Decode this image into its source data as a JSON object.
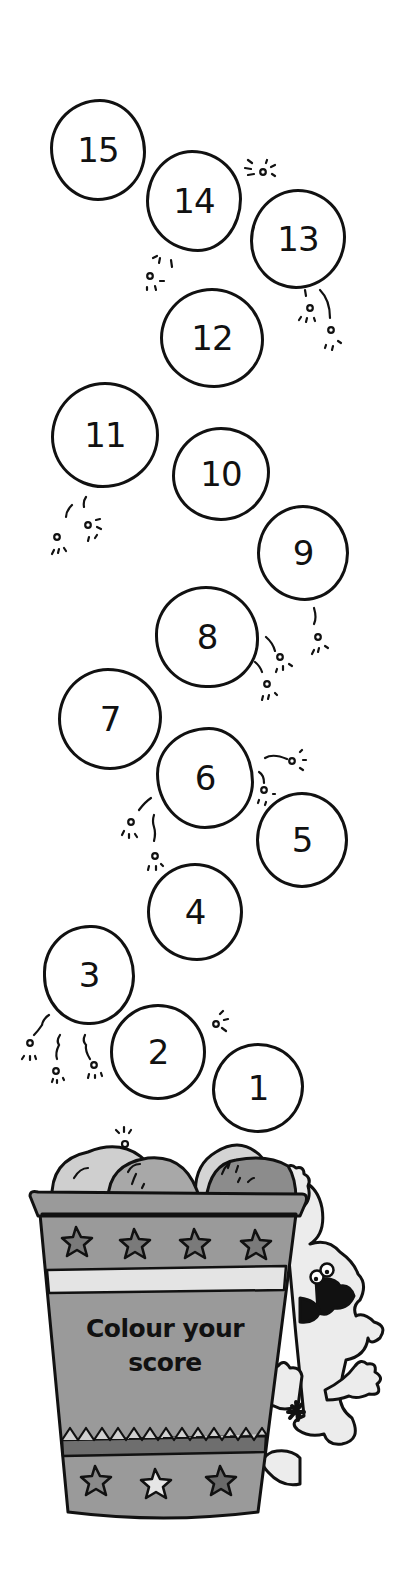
{
  "worksheet": {
    "instruction_line1": "Colour your",
    "instruction_line2": "score",
    "balloons": [
      {
        "label": "15",
        "cx": 98,
        "cy": 150,
        "w": 96,
        "h": 102,
        "r": "52% 48% 50% 50% / 48% 52% 48% 52%"
      },
      {
        "label": "14",
        "cx": 194,
        "cy": 201,
        "w": 96,
        "h": 102,
        "r": "48% 52% 46% 54% / 50% 48% 52% 50%"
      },
      {
        "label": "13",
        "cx": 298,
        "cy": 239,
        "w": 96,
        "h": 100,
        "r": "50% 50% 52% 48% / 52% 48% 52% 48%"
      },
      {
        "label": "12",
        "cx": 212,
        "cy": 338,
        "w": 104,
        "h": 100,
        "r": "50% 50% 48% 52% / 50% 52% 48% 50%"
      },
      {
        "label": "11",
        "cx": 105,
        "cy": 435,
        "w": 108,
        "h": 106,
        "r": "50% 50% 52% 48% / 52% 50% 50% 48%"
      },
      {
        "label": "10",
        "cx": 221,
        "cy": 474,
        "w": 98,
        "h": 94,
        "r": "50% 50% 50% 50% / 52% 48% 52% 48%"
      },
      {
        "label": "9",
        "cx": 303,
        "cy": 553,
        "w": 92,
        "h": 96,
        "r": "50% 50% 48% 52% / 50% 50% 50% 50%"
      },
      {
        "label": "8",
        "cx": 207,
        "cy": 637,
        "w": 104,
        "h": 102,
        "r": "50% 52% 48% 50% / 48% 52% 48% 52%"
      },
      {
        "label": "7",
        "cx": 110,
        "cy": 719,
        "w": 104,
        "h": 102,
        "r": "48% 52% 50% 50% / 50% 48% 52% 50%"
      },
      {
        "label": "6",
        "cx": 205,
        "cy": 778,
        "w": 98,
        "h": 102,
        "r": "54% 46% 50% 50% / 46% 54% 46% 54%"
      },
      {
        "label": "5",
        "cx": 302,
        "cy": 840,
        "w": 92,
        "h": 96,
        "r": "50% 50% 50% 50% / 50% 50% 50% 50%"
      },
      {
        "label": "4",
        "cx": 195,
        "cy": 912,
        "w": 96,
        "h": 98,
        "r": "50% 50% 48% 52% / 50% 50% 50% 50%"
      },
      {
        "label": "3",
        "cx": 89,
        "cy": 975,
        "w": 92,
        "h": 100,
        "r": "52% 48% 50% 50% / 48% 52% 50% 50%"
      },
      {
        "label": "2",
        "cx": 158,
        "cy": 1052,
        "w": 96,
        "h": 96,
        "r": "50% 50% 50% 50% / 50% 50% 50% 50%"
      },
      {
        "label": "1",
        "cx": 258,
        "cy": 1088,
        "w": 92,
        "h": 90,
        "r": "50% 50% 50% 50% / 52% 48% 52% 48%"
      }
    ],
    "colors": {
      "outline": "#111111",
      "bucket_fill": "#9a9a9a",
      "bucket_dark": "#6e6e6e",
      "bucket_light": "#d8d8d8",
      "popcorn_light": "#cfcfcf",
      "popcorn_mid": "#a8a8a8",
      "popcorn_dark": "#8c8c8c",
      "dog_fill": "#ececec",
      "background": "#ffffff"
    }
  }
}
